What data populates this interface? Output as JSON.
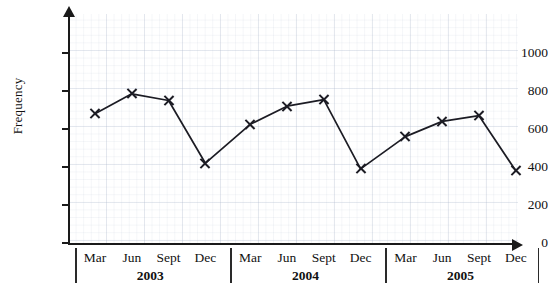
{
  "chart_data": {
    "type": "line",
    "title": "",
    "xlabel": "",
    "ylabel": "Frequency",
    "ylim": [
      0,
      1140
    ],
    "yticks": [
      0,
      200,
      400,
      600,
      800,
      1000
    ],
    "ytick_labels": [
      "0",
      "200",
      "400",
      "600",
      "800",
      "1000"
    ],
    "grid": true,
    "legend": "none",
    "marker": "x",
    "line_color": "#1c1c24",
    "grid_color": "#b0bace",
    "axis_color": "#1a1a1a",
    "categories": [
      "Mar",
      "Jun",
      "Sept",
      "Dec",
      "Mar",
      "Jun",
      "Sept",
      "Dec",
      "Mar",
      "Jun",
      "Sept",
      "Dec"
    ],
    "values": [
      680,
      785,
      750,
      420,
      625,
      720,
      755,
      390,
      560,
      640,
      670,
      380
    ],
    "points": [
      {
        "label": "Mar",
        "group": "2003",
        "value": 680
      },
      {
        "label": "Jun",
        "group": "2003",
        "value": 785
      },
      {
        "label": "Sept",
        "group": "2003",
        "value": 750
      },
      {
        "label": "Dec",
        "group": "2003",
        "value": 420
      },
      {
        "label": "Mar",
        "group": "2004",
        "value": 625
      },
      {
        "label": "Jun",
        "group": "2004",
        "value": 720
      },
      {
        "label": "Sept",
        "group": "2004",
        "value": 755
      },
      {
        "label": "Dec",
        "group": "2004",
        "value": 390
      },
      {
        "label": "Mar",
        "group": "2005",
        "value": 560
      },
      {
        "label": "Jun",
        "group": "2005",
        "value": 640
      },
      {
        "label": "Sept",
        "group": "2005",
        "value": 670
      },
      {
        "label": "Dec",
        "group": "2005",
        "value": 380
      }
    ],
    "groups": [
      "2003",
      "2004",
      "2005"
    ]
  }
}
